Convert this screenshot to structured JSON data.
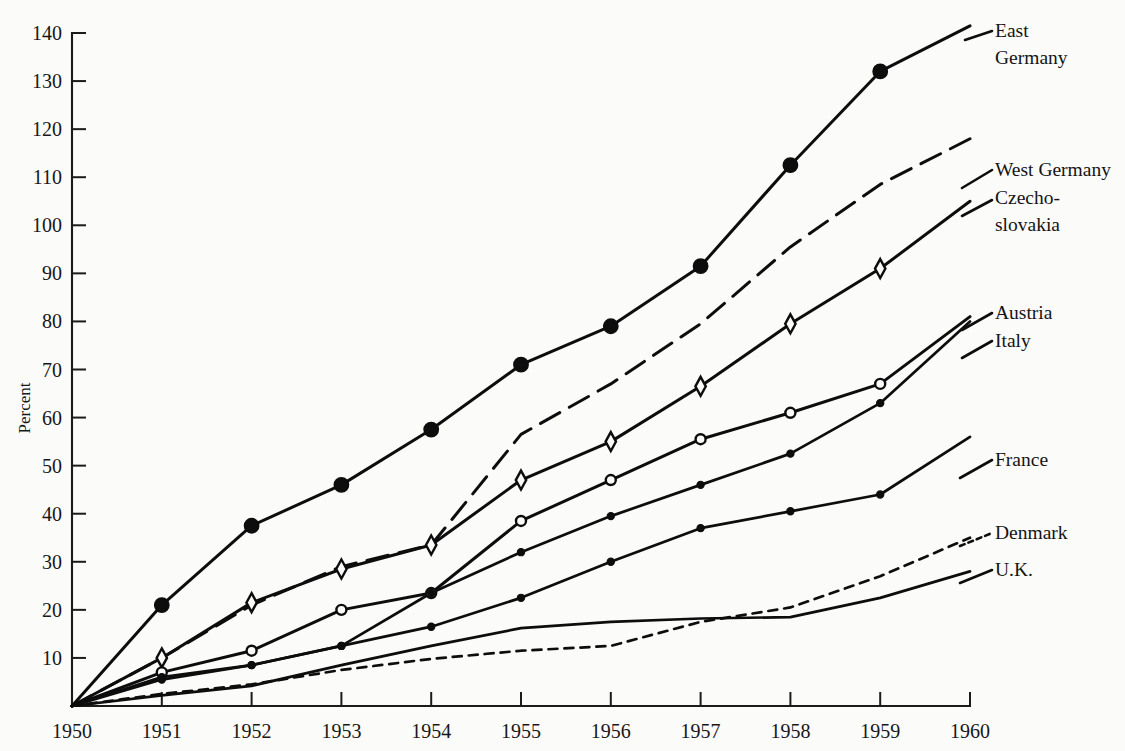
{
  "figure": {
    "background": "#fbfbfa",
    "ink": "#0d0d0d"
  },
  "axes": {
    "ylabel": "Percent",
    "y_ticks": [
      "140",
      "130",
      "120",
      "110",
      "100",
      "90",
      "80",
      "70",
      "60",
      "50",
      "40",
      "30",
      "20",
      "10"
    ],
    "x_ticks": [
      "1950",
      "1951",
      "1952",
      "1953",
      "1954",
      "1955",
      "1956",
      "1957",
      "1958",
      "1959",
      "1960"
    ]
  },
  "labels": {
    "east_germany_1": "East",
    "east_germany_2": "Germany",
    "west_germany": "West Germany",
    "czechoslovakia_1": "Czecho-",
    "czechoslovakia_2": "slovakia",
    "austria": "Austria",
    "italy": "Italy",
    "france": "France",
    "denmark": "Denmark",
    "uk": "U.K."
  },
  "chart_data": {
    "type": "line",
    "title": "",
    "xlabel": "",
    "ylabel": "Percent",
    "xlim": [
      1950,
      1960
    ],
    "ylim": [
      0,
      145
    ],
    "yticks": [
      10,
      20,
      30,
      40,
      50,
      60,
      70,
      80,
      90,
      100,
      110,
      120,
      130,
      140
    ],
    "xticks": [
      1950,
      1951,
      1952,
      1953,
      1954,
      1955,
      1956,
      1957,
      1958,
      1959,
      1960
    ],
    "grid": false,
    "legend": "right-inline-labels",
    "x": [
      1950,
      1951,
      1952,
      1953,
      1954,
      1955,
      1956,
      1957,
      1958,
      1959,
      1960
    ],
    "series": [
      {
        "name": "East Germany",
        "marker": "filled-circle",
        "linestyle": "solid",
        "values": [
          0,
          21,
          37.5,
          46,
          57.5,
          71,
          79,
          91.5,
          112.5,
          132,
          141.5
        ]
      },
      {
        "name": "West Germany",
        "marker": "none",
        "linestyle": "dashed",
        "values": [
          0,
          10,
          21,
          29,
          33.5,
          56.5,
          67,
          79.5,
          95.5,
          108.5,
          118
        ]
      },
      {
        "name": "Czechoslovakia",
        "marker": "diamond",
        "linestyle": "solid",
        "values": [
          0,
          10,
          21.5,
          28.5,
          33.5,
          47,
          55,
          66.5,
          79.5,
          91,
          105
        ]
      },
      {
        "name": "Austria",
        "marker": "open-circle",
        "linestyle": "solid",
        "values": [
          0,
          7,
          11.5,
          20,
          23.5,
          38.5,
          47,
          55.5,
          61,
          67,
          81
        ]
      },
      {
        "name": "Italy",
        "marker": "small-dot",
        "linestyle": "solid",
        "values": [
          0,
          6,
          8.5,
          12.5,
          23.5,
          32,
          39.5,
          46,
          52.5,
          63,
          80
        ]
      },
      {
        "name": "France",
        "marker": "small-dot",
        "linestyle": "solid",
        "values": [
          0,
          5.5,
          8.5,
          12.5,
          16.5,
          22.5,
          30,
          37,
          40.5,
          44,
          56
        ]
      },
      {
        "name": "Denmark",
        "marker": "none",
        "linestyle": "dotted",
        "values": [
          0,
          2.5,
          4.5,
          7.5,
          9.8,
          11.5,
          12.5,
          17.5,
          20.5,
          27,
          35
        ]
      },
      {
        "name": "U.K.",
        "marker": "none",
        "linestyle": "solid",
        "values": [
          0,
          2.2,
          4.2,
          8.5,
          12.5,
          16.2,
          17.5,
          18.2,
          18.5,
          22.5,
          28
        ]
      }
    ]
  }
}
